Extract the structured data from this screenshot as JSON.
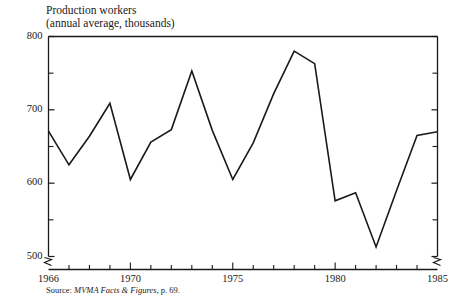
{
  "chart_data": {
    "type": "line",
    "title": "Production workers",
    "subtitle": "(annual average, thousands)",
    "xlabel": "",
    "ylabel": "",
    "ylim": [
      490,
      800
    ],
    "xlim": [
      1966,
      1985
    ],
    "yticks_major": [
      500,
      600,
      700,
      800
    ],
    "yticks_minor": [
      550,
      650,
      750
    ],
    "xticks_labeled": [
      1966,
      1970,
      1975,
      1980,
      1985
    ],
    "xticks_all": [
      1966,
      1967,
      1968,
      1969,
      1970,
      1971,
      1972,
      1973,
      1974,
      1975,
      1976,
      1977,
      1978,
      1979,
      1980,
      1981,
      1982,
      1983,
      1984,
      1985
    ],
    "grid": false,
    "legend": null,
    "axis_break_y": true,
    "axis_break_right": true,
    "x": [
      1966,
      1967,
      1968,
      1969,
      1970,
      1971,
      1972,
      1973,
      1974,
      1975,
      1976,
      1977,
      1978,
      1979,
      1980,
      1981,
      1982,
      1983,
      1984,
      1985
    ],
    "values": [
      671,
      625,
      664,
      709,
      605,
      656,
      673,
      753,
      672,
      605,
      655,
      722,
      780,
      763,
      576,
      587,
      513,
      590,
      665,
      670
    ],
    "series_name": "Production workers",
    "line_color": "#1a1a1a",
    "source": {
      "prefix": "Source: ",
      "italic": "MVMA Facts & Figures",
      "suffix": ", p. 69."
    }
  },
  "labels": {
    "y": [
      "800",
      "700",
      "600",
      "500"
    ],
    "x": [
      "1966",
      "1970",
      "1975",
      "1980",
      "1985"
    ]
  }
}
